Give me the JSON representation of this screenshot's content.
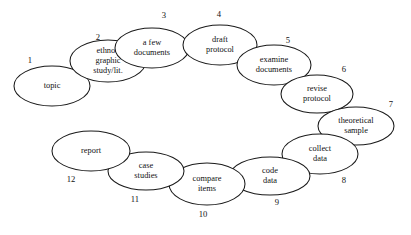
{
  "diagram": {
    "type": "cycle",
    "background_color": "#ffffff",
    "stroke_color": "#1a1a1a",
    "text_color": "#111111",
    "node_count": 12,
    "nodes": [
      {
        "number": "1",
        "lines": [
          "topic"
        ],
        "cx": 52,
        "cy": 86,
        "rx": 38,
        "ry": 20,
        "num_x": 30,
        "num_y": 61
      },
      {
        "number": "2",
        "lines": [
          "ethno–",
          "graphic",
          "study/lit."
        ],
        "cx": 108,
        "cy": 61,
        "rx": 38,
        "ry": 21,
        "num_x": 98,
        "num_y": 38
      },
      {
        "number": "3",
        "lines": [
          "a few",
          "documents"
        ],
        "cx": 152,
        "cy": 48,
        "rx": 37,
        "ry": 20,
        "num_x": 164,
        "num_y": 16
      },
      {
        "number": "4",
        "lines": [
          "draft",
          "protocol"
        ],
        "cx": 220,
        "cy": 45,
        "rx": 37,
        "ry": 20,
        "num_x": 219,
        "num_y": 15
      },
      {
        "number": "5",
        "lines": [
          "examine",
          "documents"
        ],
        "cx": 274,
        "cy": 65,
        "rx": 37,
        "ry": 20,
        "num_x": 288,
        "num_y": 41
      },
      {
        "number": "6",
        "lines": [
          "revise",
          "protocol"
        ],
        "cx": 317,
        "cy": 94,
        "rx": 36,
        "ry": 19,
        "num_x": 344,
        "num_y": 70
      },
      {
        "number": "7",
        "lines": [
          "theoretical",
          "sample"
        ],
        "cx": 356,
        "cy": 126,
        "rx": 38,
        "ry": 19,
        "num_x": 391,
        "num_y": 105
      },
      {
        "number": "8",
        "lines": [
          "collect",
          "data"
        ],
        "cx": 320,
        "cy": 154,
        "rx": 38,
        "ry": 20,
        "num_x": 344,
        "num_y": 181
      },
      {
        "number": "9",
        "lines": [
          "code",
          "data"
        ],
        "cx": 270,
        "cy": 176,
        "rx": 40,
        "ry": 19,
        "num_x": 277,
        "num_y": 203
      },
      {
        "number": "10",
        "lines": [
          "compare",
          "items"
        ],
        "cx": 207,
        "cy": 184,
        "rx": 38,
        "ry": 21,
        "num_x": 203,
        "num_y": 215
      },
      {
        "number": "11",
        "lines": [
          "case",
          "studies"
        ],
        "cx": 146,
        "cy": 171,
        "rx": 38,
        "ry": 19,
        "num_x": 135,
        "num_y": 200
      },
      {
        "number": "12",
        "lines": [
          "report"
        ],
        "cx": 91,
        "cy": 151,
        "rx": 39,
        "ry": 20,
        "num_x": 71,
        "num_y": 180
      }
    ]
  }
}
